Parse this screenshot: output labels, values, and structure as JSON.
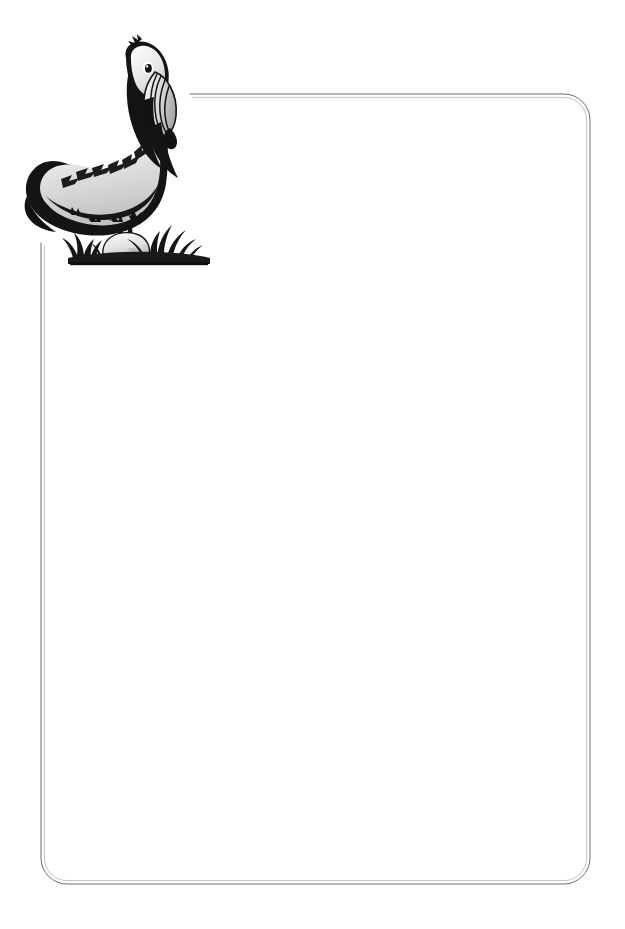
{
  "document": {
    "kind": "stationery-sheet",
    "title": "Blank Pelican Stationery Sheet",
    "page_width": 625,
    "page_height": 929,
    "background_color": "#ffffff",
    "body_text": "",
    "orientation": "portrait"
  },
  "illustration": {
    "name": "brown-pelican-on-grassy-bank",
    "subject": "Brown Pelican",
    "style": "black-and-white woodcut / scratchboard line art",
    "position": "upper-left",
    "bounds": {
      "x": 24,
      "y": 42,
      "width": 196,
      "height": 222
    },
    "colors": {
      "ink": "#1a1a1a",
      "outline": "#111111",
      "body_gray": "#d9d9d9",
      "shadow_gray": "#8a8a8a",
      "mid_gray": "#b4b4b4",
      "highlight": "#ffffff"
    },
    "parts": [
      {
        "name": "head",
        "label": "Head"
      },
      {
        "name": "eye",
        "label": "Eye"
      },
      {
        "name": "bill",
        "label": "Long hooked bill"
      },
      {
        "name": "pouch",
        "label": "Throat pouch"
      },
      {
        "name": "neck",
        "label": "Neck"
      },
      {
        "name": "breast",
        "label": "Breast"
      },
      {
        "name": "wing",
        "label": "Folded wing"
      },
      {
        "name": "back",
        "label": "Back"
      },
      {
        "name": "tail",
        "label": "Tail"
      },
      {
        "name": "legs",
        "label": "Legs and webbed feet"
      },
      {
        "name": "grass",
        "label": "Grass tuft base"
      },
      {
        "name": "rock",
        "label": "Rock"
      },
      {
        "name": "ground",
        "label": "Ground line"
      }
    ]
  },
  "border": {
    "name": "rounded-rectangle-rule",
    "style": "double thin rule",
    "color": "#6e6e6e",
    "stroke_width": 0.9,
    "corner_radius": 26,
    "left": 41,
    "top": 94,
    "right": 590,
    "bottom": 884,
    "gap_note": "Rule is interrupted at upper-left where the pelican illustration overlaps",
    "top_rule_start_x": 190,
    "left_rule_start_y": 243
  }
}
